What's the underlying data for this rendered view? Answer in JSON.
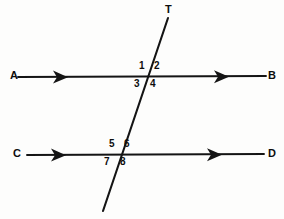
{
  "figure": {
    "background_color": "#fdfdfc",
    "stroke_color": "#141414"
  },
  "lines": [
    {
      "id": "line-ab",
      "name": "upper-parallel-line",
      "start_label": "A",
      "end_label": "B",
      "x1": 18,
      "y1": 77,
      "x2": 266,
      "y2": 76,
      "arrow_positions": [
        "left-mid",
        "right-mid"
      ]
    },
    {
      "id": "line-cd",
      "name": "lower-parallel-line",
      "start_label": "C",
      "end_label": "D",
      "x1": 27,
      "y1": 155,
      "x2": 264,
      "y2": 154,
      "arrow_positions": [
        "left-mid",
        "right-mid"
      ]
    },
    {
      "id": "line-t",
      "name": "transversal-line",
      "start_label": "T",
      "end_label": "",
      "x1": 168,
      "y1": 18,
      "x2": 103,
      "y2": 211,
      "arrow_positions": []
    }
  ],
  "endpoint_labels": [
    {
      "text": "A",
      "x": 10,
      "y": 70
    },
    {
      "text": "B",
      "x": 268,
      "y": 70
    },
    {
      "text": "C",
      "x": 13,
      "y": 148
    },
    {
      "text": "D",
      "x": 268,
      "y": 148
    },
    {
      "text": "T",
      "x": 165,
      "y": 4
    }
  ],
  "angle_labels": [
    {
      "text": "1",
      "x": 139,
      "y": 61,
      "quadrant": "upper-left",
      "vertex": "upper-intersection"
    },
    {
      "text": "2",
      "x": 154,
      "y": 61,
      "quadrant": "upper-right",
      "vertex": "upper-intersection"
    },
    {
      "text": "3",
      "x": 134,
      "y": 79,
      "quadrant": "lower-left",
      "vertex": "upper-intersection"
    },
    {
      "text": "4",
      "x": 150,
      "y": 79,
      "quadrant": "lower-right",
      "vertex": "upper-intersection"
    },
    {
      "text": "5",
      "x": 109,
      "y": 139,
      "quadrant": "upper-left",
      "vertex": "lower-intersection"
    },
    {
      "text": "6",
      "x": 124,
      "y": 139,
      "quadrant": "upper-right",
      "vertex": "lower-intersection"
    },
    {
      "text": "7",
      "x": 104,
      "y": 157,
      "quadrant": "lower-left",
      "vertex": "lower-intersection"
    },
    {
      "text": "8",
      "x": 120,
      "y": 157,
      "quadrant": "lower-right",
      "vertex": "lower-intersection"
    }
  ],
  "intersections": [
    {
      "name": "upper-intersection",
      "x": 148,
      "y": 77
    },
    {
      "name": "lower-intersection",
      "x": 118,
      "y": 154
    }
  ]
}
